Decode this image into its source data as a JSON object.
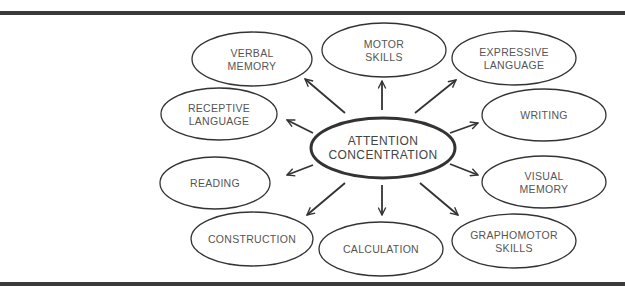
{
  "diagram": {
    "type": "hub-and-spoke",
    "colors": {
      "stroke": "#333333",
      "text": "#555555",
      "rule": "#3a3a3a",
      "background": "#ffffff"
    },
    "center": {
      "id": "attention",
      "lines": [
        "ATTENTION",
        "CONCENTRATION"
      ],
      "cx": 383,
      "cy": 148,
      "rx": 72,
      "ry": 30
    },
    "nodes": [
      {
        "id": "verbal-memory",
        "lines": [
          "VERBAL",
          "MEMORY"
        ],
        "cx": 252,
        "cy": 59,
        "rx": 60,
        "ry": 27
      },
      {
        "id": "motor-skills",
        "lines": [
          "MOTOR",
          "SKILLS"
        ],
        "cx": 384,
        "cy": 50,
        "rx": 62,
        "ry": 27
      },
      {
        "id": "expressive-language",
        "lines": [
          "EXPRESSIVE",
          "LANGUAGE"
        ],
        "cx": 514,
        "cy": 58,
        "rx": 62,
        "ry": 27
      },
      {
        "id": "receptive-language",
        "lines": [
          "RECEPTIVE",
          "LANGUAGE"
        ],
        "cx": 219,
        "cy": 114,
        "rx": 58,
        "ry": 26
      },
      {
        "id": "writing",
        "lines": [
          "WRITING"
        ],
        "cx": 544,
        "cy": 115,
        "rx": 62,
        "ry": 26
      },
      {
        "id": "reading",
        "lines": [
          "READING"
        ],
        "cx": 215,
        "cy": 183,
        "rx": 55,
        "ry": 26
      },
      {
        "id": "visual-memory",
        "lines": [
          "VISUAL",
          "MEMORY"
        ],
        "cx": 544,
        "cy": 182,
        "rx": 62,
        "ry": 26
      },
      {
        "id": "construction",
        "lines": [
          "CONSTRUCTION"
        ],
        "cx": 252,
        "cy": 239,
        "rx": 61,
        "ry": 27
      },
      {
        "id": "calculation",
        "lines": [
          "CALCULATION"
        ],
        "cx": 381,
        "cy": 249,
        "rx": 62,
        "ry": 27
      },
      {
        "id": "graphomotor-skills",
        "lines": [
          "GRAPHOMOTOR",
          "SKILLS"
        ],
        "cx": 514,
        "cy": 241,
        "rx": 62,
        "ry": 27
      }
    ],
    "edges": [
      {
        "from": "attention",
        "to": "verbal-memory",
        "x1": 345,
        "y1": 113,
        "x2": 305,
        "y2": 79
      },
      {
        "from": "attention",
        "to": "receptive-language",
        "x1": 313,
        "y1": 133,
        "x2": 287,
        "y2": 120
      },
      {
        "from": "attention",
        "to": "motor-skills",
        "x1": 382,
        "y1": 110,
        "x2": 382,
        "y2": 81
      },
      {
        "from": "attention",
        "to": "expressive-language",
        "x1": 415,
        "y1": 113,
        "x2": 456,
        "y2": 80
      },
      {
        "from": "attention",
        "to": "writing",
        "x1": 450,
        "y1": 133,
        "x2": 478,
        "y2": 123
      },
      {
        "from": "attention",
        "to": "visual-memory",
        "x1": 450,
        "y1": 164,
        "x2": 478,
        "y2": 175
      },
      {
        "from": "attention",
        "to": "reading",
        "x1": 313,
        "y1": 165,
        "x2": 287,
        "y2": 175
      },
      {
        "from": "attention",
        "to": "construction",
        "x1": 345,
        "y1": 183,
        "x2": 307,
        "y2": 215
      },
      {
        "from": "attention",
        "to": "calculation",
        "x1": 382,
        "y1": 185,
        "x2": 382,
        "y2": 215
      },
      {
        "from": "attention",
        "to": "graphomotor-skills",
        "x1": 420,
        "y1": 183,
        "x2": 458,
        "y2": 215
      }
    ]
  }
}
